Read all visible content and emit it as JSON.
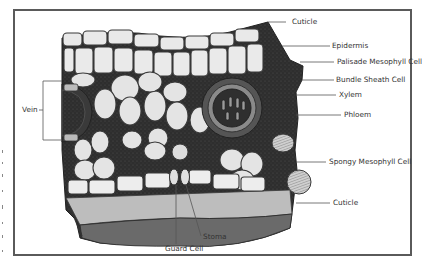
{
  "diagram": {
    "colors": {
      "frame": "#5a5a5a",
      "tissue_dark": "#2e2e2e",
      "cell_fill": "#e9e9e9",
      "cell_stroke": "#3a3a3a",
      "lower_layer": "#6a6a6a",
      "leader": "#555555",
      "label_text": "#333333"
    },
    "labels": [
      {
        "id": "cuticle-top",
        "text": "Cuticle"
      },
      {
        "id": "epidermis",
        "text": "Epidermis"
      },
      {
        "id": "palisade",
        "text": "Palisade Mesophyll Cell"
      },
      {
        "id": "bundle-sheath",
        "text": "Bundle Sheath Cell"
      },
      {
        "id": "xylem",
        "text": "Xylem"
      },
      {
        "id": "phloem",
        "text": "Phloem"
      },
      {
        "id": "spongy",
        "text": "Spongy Mesophyll Cell"
      },
      {
        "id": "cuticle-bottom",
        "text": "Cuticle"
      },
      {
        "id": "vein",
        "text": "Vein"
      },
      {
        "id": "guard-cell",
        "text": "Guard Cell"
      },
      {
        "id": "stoma",
        "text": "Stoma"
      }
    ]
  }
}
